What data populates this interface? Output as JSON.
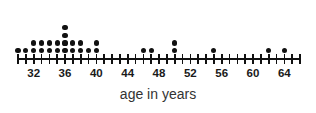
{
  "chart_data": {
    "type": "dotplot",
    "title": "",
    "xlabel": "age in years",
    "ylabel": "",
    "xlim": [
      30,
      66
    ],
    "tick_step": 1,
    "label_step": 4,
    "grid": false,
    "legend": null,
    "tick_labels": [
      "32",
      "36",
      "40",
      "44",
      "48",
      "52",
      "56",
      "60",
      "64"
    ],
    "tick_label_values": [
      32,
      36,
      40,
      44,
      48,
      52,
      56,
      60,
      64
    ],
    "dot_color": "#111111",
    "axis_color": "#111111",
    "categories": [
      30,
      31,
      32,
      33,
      34,
      35,
      36,
      37,
      38,
      39,
      40,
      41,
      42,
      43,
      44,
      45,
      46,
      47,
      48,
      49,
      50,
      51,
      52,
      53,
      54,
      55,
      56,
      57,
      58,
      59,
      60,
      61,
      62,
      63,
      64,
      65,
      66
    ],
    "values": [
      1,
      1,
      2,
      2,
      2,
      2,
      4,
      2,
      2,
      1,
      2,
      0,
      0,
      0,
      0,
      0,
      1,
      1,
      0,
      0,
      2,
      0,
      0,
      0,
      0,
      1,
      0,
      0,
      0,
      0,
      0,
      0,
      1,
      0,
      1,
      0,
      0
    ],
    "total_dots": 28
  },
  "axis": {
    "title": "age in years"
  }
}
